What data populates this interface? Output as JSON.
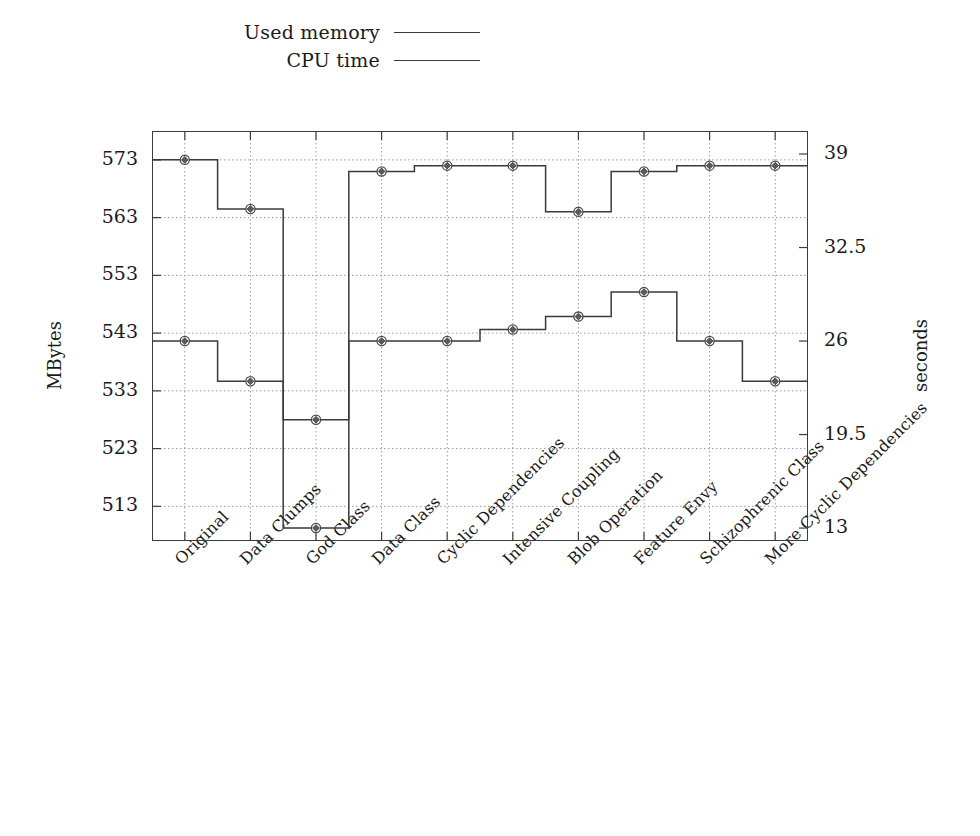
{
  "legend": {
    "items": [
      {
        "label": "Used memory",
        "color": "#3a3a3a"
      },
      {
        "label": "CPU time",
        "color": "#3a3a3a"
      }
    ]
  },
  "axes": {
    "left_title": "MBytes",
    "right_title": "seconds",
    "left_ticks": [
      "573",
      "563",
      "553",
      "543",
      "533",
      "523",
      "513"
    ],
    "right_ticks": [
      "39",
      "32.5",
      "26",
      "19.5",
      "13"
    ]
  },
  "chart_data": {
    "type": "line",
    "title": "",
    "xlabel": "",
    "ylabel": "MBytes",
    "y2label": "seconds",
    "style": "step",
    "grid": true,
    "legend_position": "top",
    "categories": [
      "Original",
      "Data Clumps",
      "God Class",
      "Data Class",
      "Cyclic Dependencies",
      "Intensive Coupling",
      "Blob Operation",
      "Feature Envy",
      "Schizophrenic Class",
      "More Cyclic Dependencies"
    ],
    "ylim": [
      507,
      578
    ],
    "ylim_right": [
      12.1,
      40.6
    ],
    "yticks": [
      573,
      563,
      553,
      543,
      533,
      523,
      513
    ],
    "yticks_right": [
      39,
      32.5,
      26,
      19.5,
      13
    ],
    "series": [
      {
        "name": "Used memory",
        "axis": "left",
        "units": "MBytes",
        "values": [
          573,
          564.5,
          528,
          571,
          572,
          572,
          564,
          571,
          572,
          572
        ]
      },
      {
        "name": "CPU time",
        "axis": "right",
        "units": "seconds",
        "values": [
          26,
          23.2,
          13,
          26,
          26,
          26.8,
          27.7,
          29.4,
          26,
          23.2
        ]
      }
    ]
  }
}
